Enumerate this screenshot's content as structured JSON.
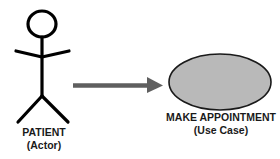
{
  "diagram": {
    "type": "use-case",
    "actor": {
      "name": "PATIENT",
      "role": "(Actor)",
      "icon": "stick-figure-icon",
      "stroke_color": "#000000"
    },
    "association": {
      "from": "PATIENT",
      "to": "MAKE APPOINTMENT",
      "icon": "arrow-right-icon",
      "color": "#5f5f5f"
    },
    "use_case": {
      "name": "MAKE APPOINTMENT",
      "kind": "(Use Case)",
      "fill_color": "#b9b9b9",
      "stroke_color": "#1a1a1a"
    }
  }
}
